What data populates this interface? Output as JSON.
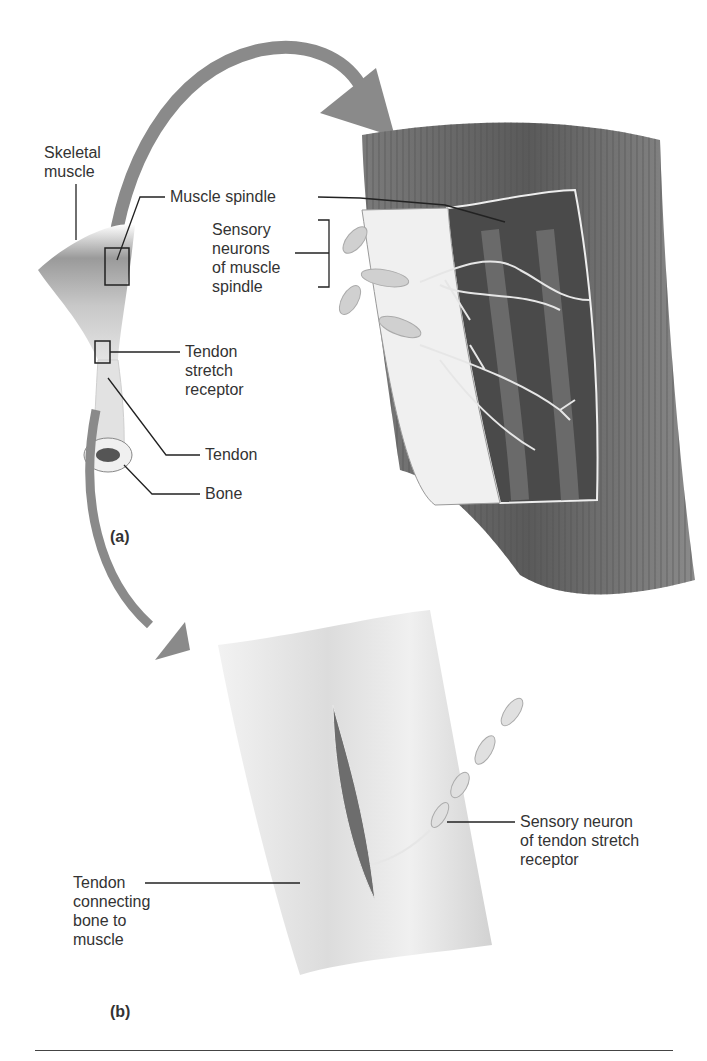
{
  "figure": {
    "panel_a": {
      "id": "(a)",
      "labels": {
        "skeletal_muscle": [
          "Skeletal",
          "muscle"
        ],
        "muscle_spindle": "Muscle spindle",
        "sensory_neurons": [
          "Sensory",
          "neurons",
          "of muscle",
          "spindle"
        ],
        "tendon_stretch_receptor": [
          "Tendon",
          "stretch",
          "receptor"
        ],
        "tendon": "Tendon",
        "bone": "Bone"
      }
    },
    "panel_b": {
      "id": "(b)",
      "labels": {
        "tendon_connecting": [
          "Tendon",
          "connecting",
          "bone to",
          "muscle"
        ],
        "sensory_neuron_tendon": [
          "Sensory neuron",
          "of tendon stretch",
          "receptor"
        ]
      }
    },
    "colors": {
      "arrow": "#8a8a8a",
      "muscle_dark": "#5e5e5e",
      "muscle_mid": "#8c8c8c",
      "tendon_light": "#e6e6e6",
      "neuron": "#d4d4d4",
      "leader_line": "#222222"
    }
  }
}
